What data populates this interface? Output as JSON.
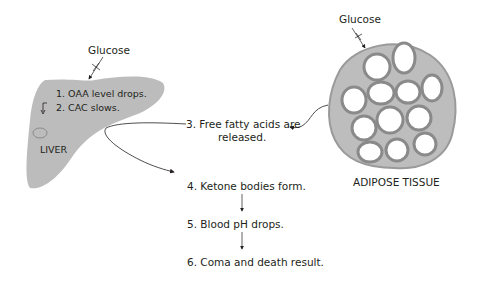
{
  "liver": {
    "glucose_label": "Glucose",
    "step1": "1. OAA level drops.",
    "step2": "2. CAC slows.",
    "name": "LIVER",
    "fill_color": "#bcbcbc"
  },
  "adipose": {
    "glucose_label": "Glucose",
    "name": "ADIPOSE TISSUE",
    "tissue_color": "#8a8a8a"
  },
  "flow": {
    "step3_line1": "3. Free fatty acids are",
    "step3_line2": "released.",
    "step4": "4. Ketone bodies form.",
    "step5": "5. Blood pH drops.",
    "step6": "6. Coma and death result."
  },
  "icons": {
    "blocked_arrow": "x-cross-arrow",
    "down_arrow": "down-arrow",
    "cycle": "cycle-circle"
  }
}
